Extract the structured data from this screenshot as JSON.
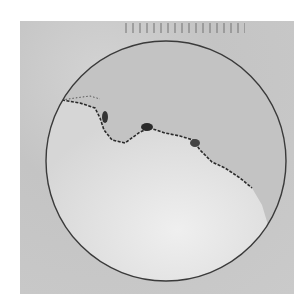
{
  "image": {
    "description": "Grayscale photograph of a circular dish showing a dark irregular boundary line separating a darker upper region from a lighter lower region",
    "colors": {
      "background": "#c9c9c9",
      "upper_region": "#bdbdbd",
      "lower_region": "#e2e2e2",
      "boundary": "#2a2a2a",
      "rim": "#3a3a3a"
    }
  }
}
